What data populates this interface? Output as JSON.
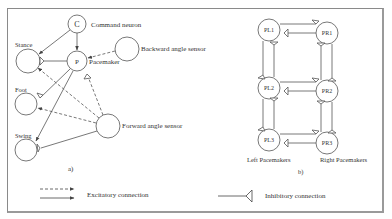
{
  "diagram": {
    "panel_a": {
      "caption": "a)",
      "nodes": {
        "command": {
          "glyph": "C",
          "label": "Command neuron"
        },
        "pacemaker": {
          "glyph": "P",
          "label": "Pacemaker"
        },
        "stance": {
          "label": "Stance"
        },
        "foot": {
          "label": "Foot"
        },
        "swing": {
          "label": "Swing"
        },
        "backward_sensor": {
          "label": "Backward angle sensor"
        },
        "forward_sensor": {
          "label": "Forward angle sensor"
        }
      }
    },
    "panel_b": {
      "caption": "b)",
      "nodes": {
        "pl1": "PL1",
        "pl2": "PL2",
        "pl3": "PL3",
        "pr1": "PR1",
        "pr2": "PR2",
        "pr3": "PR3"
      },
      "left_group_label": "Left  Pacemakers",
      "right_group_label": "Right Pacemakers"
    },
    "legend": {
      "excitatory": "Excitatory connection",
      "inhibitory": "Inhibitory connection"
    }
  }
}
